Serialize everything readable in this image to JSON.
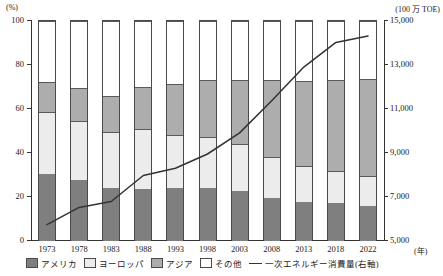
{
  "axes": {
    "left_unit": "(%)",
    "right_unit": "(100 万 TOE)",
    "x_unit": "(年)",
    "left_ticks": [
      "100",
      "80",
      "60",
      "40",
      "20",
      "0"
    ],
    "right_ticks": [
      "15,000",
      "13,000",
      "11,000",
      "9,000",
      "7,000",
      "5,000"
    ]
  },
  "legend": {
    "america": "アメリカ",
    "europe": "ヨーロッパ",
    "asia": "アジア",
    "other": "その他",
    "line": "一次エネルギー消費量(右軸)"
  },
  "colors": {
    "america": "#7f7f7f",
    "europe": "#ececec",
    "asia": "#adadad",
    "other": "#ffffff",
    "line": "#333333"
  },
  "chart_data": {
    "type": "bar",
    "title": "",
    "xlabel": "(年)",
    "ylabel": "(%)",
    "ylabel_right": "(100 万 TOE)",
    "ylim": [
      0,
      100
    ],
    "ylim_right": [
      5000,
      15000
    ],
    "grid": false,
    "stacked": true,
    "legend_position": "bottom",
    "categories": [
      "1973",
      "1978",
      "1983",
      "1988",
      "1993",
      "1998",
      "2003",
      "2008",
      "2013",
      "2018",
      "2022"
    ],
    "series": [
      {
        "name": "アメリカ",
        "axis": "left",
        "values": [
          30.5,
          27.8,
          24.3,
          23.8,
          24.2,
          24.2,
          22.7,
          19.5,
          17.8,
          17.2,
          16.0
        ]
      },
      {
        "name": "ヨーロッパ",
        "axis": "left",
        "values": [
          28.0,
          26.8,
          25.2,
          27.3,
          24.1,
          23.0,
          21.2,
          18.5,
          16.1,
          14.6,
          13.5
        ]
      },
      {
        "name": "アジア",
        "axis": "left",
        "values": [
          13.7,
          15.1,
          16.5,
          18.9,
          23.1,
          26.1,
          29.3,
          35.2,
          38.9,
          41.5,
          44.0
        ]
      },
      {
        "name": "その他",
        "axis": "left",
        "values": [
          27.8,
          30.3,
          34.0,
          30.0,
          28.6,
          26.7,
          26.8,
          26.8,
          27.2,
          26.7,
          26.5
        ]
      },
      {
        "name": "一次エネルギー消費量(右軸)",
        "axis": "right",
        "type": "line",
        "values": [
          5700,
          6480,
          6750,
          7930,
          8260,
          8910,
          9870,
          11330,
          12860,
          13980,
          14270
        ]
      }
    ]
  }
}
